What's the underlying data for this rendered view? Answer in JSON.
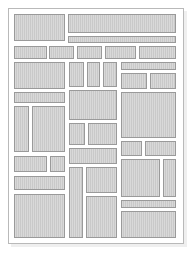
{
  "canvas": {
    "width": 192,
    "height": 259,
    "background": "#ffffff"
  },
  "page": {
    "frame": {
      "x": 8,
      "y": 8,
      "width": 176,
      "height": 236
    },
    "frame_border_color": "#b9b9b9",
    "shadow_color": "#efefef",
    "block_fill_color": "#c9c9c9",
    "block_border_color": "#9a9a9a",
    "block_count": 36
  },
  "blocks": [
    {
      "id": "block-01",
      "label": "",
      "x": 14,
      "y": 14,
      "width": 51,
      "height": 27
    },
    {
      "id": "block-02",
      "label": "",
      "x": 68,
      "y": 14,
      "width": 108,
      "height": 19
    },
    {
      "id": "block-03",
      "label": "",
      "x": 68,
      "y": 36,
      "width": 108,
      "height": 7
    },
    {
      "id": "block-04",
      "label": "",
      "x": 14,
      "y": 46,
      "width": 33,
      "height": 13
    },
    {
      "id": "block-05",
      "label": "",
      "x": 49,
      "y": 46,
      "width": 25,
      "height": 13
    },
    {
      "id": "block-06",
      "label": "",
      "x": 77,
      "y": 46,
      "width": 25,
      "height": 13
    },
    {
      "id": "block-07",
      "label": "",
      "x": 105,
      "y": 46,
      "width": 31,
      "height": 13
    },
    {
      "id": "block-08",
      "label": "",
      "x": 139,
      "y": 46,
      "width": 37,
      "height": 13
    },
    {
      "id": "block-09",
      "label": "",
      "x": 14,
      "y": 62,
      "width": 51,
      "height": 27
    },
    {
      "id": "block-10",
      "label": "",
      "x": 69,
      "y": 62,
      "width": 15,
      "height": 25
    },
    {
      "id": "block-11",
      "label": "",
      "x": 87,
      "y": 62,
      "width": 13,
      "height": 25
    },
    {
      "id": "block-12",
      "label": "",
      "x": 103,
      "y": 62,
      "width": 14,
      "height": 25
    },
    {
      "id": "block-13",
      "label": "",
      "x": 121,
      "y": 62,
      "width": 55,
      "height": 8
    },
    {
      "id": "block-14",
      "label": "",
      "x": 121,
      "y": 73,
      "width": 26,
      "height": 16
    },
    {
      "id": "block-15",
      "label": "",
      "x": 150,
      "y": 73,
      "width": 26,
      "height": 16
    },
    {
      "id": "block-16",
      "label": "",
      "x": 14,
      "y": 92,
      "width": 51,
      "height": 11
    },
    {
      "id": "block-17",
      "label": "",
      "x": 69,
      "y": 90,
      "width": 48,
      "height": 30
    },
    {
      "id": "block-18",
      "label": "",
      "x": 121,
      "y": 92,
      "width": 55,
      "height": 46
    },
    {
      "id": "block-19",
      "label": "",
      "x": 14,
      "y": 106,
      "width": 15,
      "height": 46
    },
    {
      "id": "block-20",
      "label": "",
      "x": 32,
      "y": 106,
      "width": 33,
      "height": 46
    },
    {
      "id": "block-21",
      "label": "",
      "x": 69,
      "y": 123,
      "width": 16,
      "height": 22
    },
    {
      "id": "block-22",
      "label": "",
      "x": 88,
      "y": 123,
      "width": 29,
      "height": 22
    },
    {
      "id": "block-23",
      "label": "",
      "x": 121,
      "y": 141,
      "width": 21,
      "height": 15
    },
    {
      "id": "block-24",
      "label": "",
      "x": 145,
      "y": 141,
      "width": 31,
      "height": 15
    },
    {
      "id": "block-25",
      "label": "",
      "x": 69,
      "y": 148,
      "width": 48,
      "height": 16
    },
    {
      "id": "block-26",
      "label": "",
      "x": 14,
      "y": 156,
      "width": 33,
      "height": 16
    },
    {
      "id": "block-27",
      "label": "",
      "x": 50,
      "y": 156,
      "width": 15,
      "height": 16
    },
    {
      "id": "block-28",
      "label": "",
      "x": 121,
      "y": 159,
      "width": 39,
      "height": 38
    },
    {
      "id": "block-29",
      "label": "",
      "x": 163,
      "y": 159,
      "width": 13,
      "height": 38
    },
    {
      "id": "block-30",
      "label": "",
      "x": 69,
      "y": 167,
      "width": 14,
      "height": 71
    },
    {
      "id": "block-31",
      "label": "",
      "x": 86,
      "y": 167,
      "width": 31,
      "height": 26
    },
    {
      "id": "block-32",
      "label": "",
      "x": 14,
      "y": 176,
      "width": 51,
      "height": 14
    },
    {
      "id": "block-33",
      "label": "",
      "x": 86,
      "y": 196,
      "width": 31,
      "height": 42
    },
    {
      "id": "block-34",
      "label": "",
      "x": 14,
      "y": 194,
      "width": 51,
      "height": 44
    },
    {
      "id": "block-35",
      "label": "",
      "x": 121,
      "y": 200,
      "width": 55,
      "height": 8
    },
    {
      "id": "block-36",
      "label": "",
      "x": 121,
      "y": 211,
      "width": 55,
      "height": 27
    }
  ]
}
